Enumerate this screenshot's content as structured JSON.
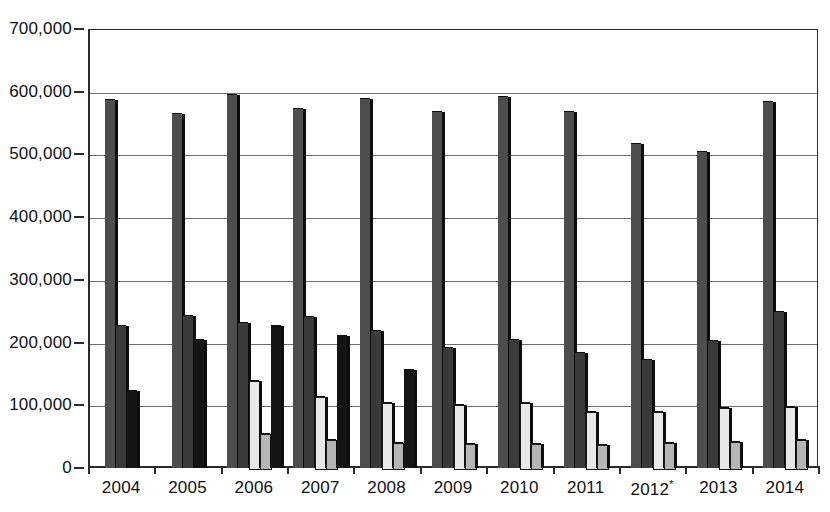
{
  "chart_data": {
    "type": "bar",
    "title": "",
    "subtitle": "",
    "xlabel": "",
    "ylabel": "",
    "ylim": [
      0,
      700000
    ],
    "ytick_step": 100000,
    "ytick_labels": [
      "0",
      "100,000",
      "200,000",
      "300,000",
      "400,000",
      "500,000",
      "600,000",
      "700,000"
    ],
    "ytick_values": [
      0,
      100000,
      200000,
      300000,
      400000,
      500000,
      600000,
      700000
    ],
    "grid": true,
    "grid_axis": "y",
    "legend_position": "none",
    "categories": [
      "2004",
      "2005",
      "2006",
      "2007",
      "2008",
      "2009",
      "2010",
      "2011",
      "2012",
      "2013",
      "2014"
    ],
    "category_notes": {
      "2012": "*"
    },
    "series": [
      {
        "name": "series-a",
        "color": "#4d4d4d",
        "values": [
          587000,
          565000,
          595000,
          572000,
          589000,
          567000,
          591000,
          567000,
          516000,
          504000,
          584000
        ]
      },
      {
        "name": "series-b",
        "color": "#3a3a3a",
        "values": [
          227000,
          243000,
          232000,
          241000,
          218000,
          192000,
          204000,
          184000,
          172000,
          202000,
          249000
        ]
      },
      {
        "name": "series-c",
        "color": "#e8e8e8",
        "values": [
          null,
          null,
          139000,
          113000,
          103000,
          100000,
          103000,
          90000,
          90000,
          95000,
          98000
        ]
      },
      {
        "name": "series-d",
        "color": "#b5b5b5",
        "values": [
          null,
          null,
          55000,
          45000,
          40000,
          38000,
          38000,
          37000,
          40000,
          42000,
          45000
        ]
      },
      {
        "name": "series-e",
        "color": "#141414",
        "values": [
          123000,
          204000,
          227000,
          210000,
          157000,
          null,
          null,
          null,
          null,
          null,
          null
        ]
      }
    ]
  }
}
